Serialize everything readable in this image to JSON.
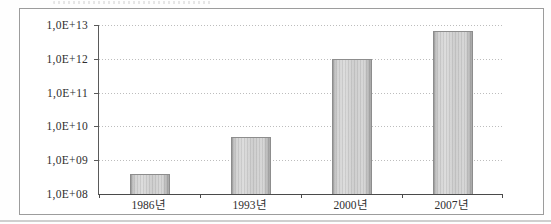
{
  "page": {
    "background": "#fefefe",
    "frame_border_color": "#9c9c9c"
  },
  "chart_data": {
    "type": "bar",
    "categories": [
      "1986년",
      "1993년",
      "2000년",
      "2007년"
    ],
    "values": [
      400000000,
      5000000000,
      1000000000000,
      6500000000000
    ],
    "title": "",
    "xlabel": "",
    "ylabel": "",
    "y_scale": "log10",
    "ylim": [
      100000000,
      10000000000000
    ],
    "y_tick_labels": [
      "1,0E+08",
      "1,0E+09",
      "1,0E+10",
      "1,0E+11",
      "1,0E+12",
      "1,0E+13"
    ],
    "grid": "horizontal-dotted",
    "legend": "none",
    "colors": {
      "bar_fill": "#cccccc",
      "bar_fill_highlight": "#d9d9d9",
      "bar_border": "#8d8d8d",
      "gridline": "#bdbdbd",
      "axis": "#4a4a4a",
      "text": "#2e2e2e"
    }
  }
}
